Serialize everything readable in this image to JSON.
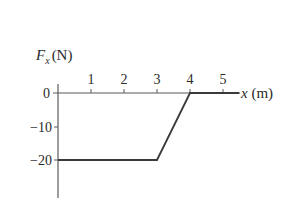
{
  "chart_data": {
    "type": "line",
    "title": "",
    "xlabel": "x (m)",
    "ylabel": "Fx (N)",
    "ylabel_main": "F",
    "ylabel_sub": "x",
    "ylabel_unit": "(N)",
    "x_ticks": [
      "1",
      "2",
      "3",
      "4",
      "5"
    ],
    "y_ticks": [
      "0",
      "−10",
      "−20"
    ],
    "xlim": [
      0,
      5.6
    ],
    "ylim": [
      -30,
      0
    ],
    "grid": false,
    "legend": null,
    "series": [
      {
        "name": "Fx",
        "x": [
          0,
          3,
          4,
          5.5
        ],
        "y": [
          -20,
          -20,
          0,
          0
        ]
      }
    ]
  },
  "colors": {
    "line": "#3a3a3a",
    "axis": "#5a5a5a",
    "text": "#2a2a2a"
  }
}
